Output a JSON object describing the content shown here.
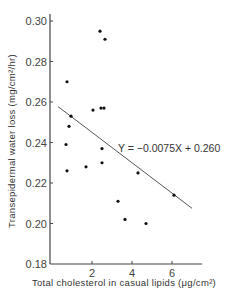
{
  "chart_data": {
    "type": "scatter",
    "title": "",
    "xlabel": "Total cholesterol in casual lipids (μg/cm²)",
    "ylabel": "Transepidermal water loss (mg/cm²/hr)",
    "xlim": [
      0,
      7.3
    ],
    "ylim": [
      0.18,
      0.3
    ],
    "xticks": [
      2,
      4,
      6
    ],
    "xtick_labels": [
      "2",
      "4",
      "6"
    ],
    "yticks": [
      0.18,
      0.2,
      0.22,
      0.24,
      0.26,
      0.28,
      0.3
    ],
    "ytick_labels": [
      "0.18",
      "0.20",
      "0.22",
      "0.24",
      "0.26",
      "0.28",
      "0.30"
    ],
    "grid": false,
    "legend": null,
    "series": [
      {
        "name": "observations",
        "points": [
          {
            "x": 0.75,
            "y": 0.27
          },
          {
            "x": 0.95,
            "y": 0.253
          },
          {
            "x": 0.85,
            "y": 0.248
          },
          {
            "x": 0.7,
            "y": 0.239
          },
          {
            "x": 0.75,
            "y": 0.226
          },
          {
            "x": 1.7,
            "y": 0.228
          },
          {
            "x": 2.05,
            "y": 0.256
          },
          {
            "x": 2.45,
            "y": 0.257
          },
          {
            "x": 2.6,
            "y": 0.257
          },
          {
            "x": 2.4,
            "y": 0.295
          },
          {
            "x": 2.65,
            "y": 0.291
          },
          {
            "x": 2.5,
            "y": 0.237
          },
          {
            "x": 2.5,
            "y": 0.23
          },
          {
            "x": 3.3,
            "y": 0.211
          },
          {
            "x": 3.65,
            "y": 0.202
          },
          {
            "x": 4.3,
            "y": 0.225
          },
          {
            "x": 4.7,
            "y": 0.2
          },
          {
            "x": 6.1,
            "y": 0.214
          }
        ]
      }
    ],
    "regression": {
      "equation": "Y = −0.0075X + 0.260",
      "slope": -0.0075,
      "intercept": 0.26,
      "x_range": [
        0.3,
        7.0
      ]
    }
  },
  "labels": {
    "equation": "Y = −0.0075X + 0.260",
    "xlabel": "Total cholesterol in casual lipids (μg/cm²)",
    "ylabel": "Transepidermal water loss (mg/cm²/hr)"
  }
}
